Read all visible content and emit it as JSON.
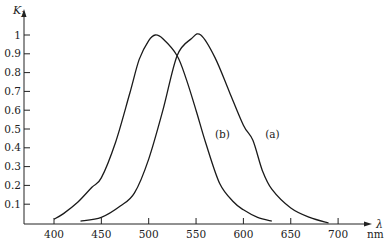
{
  "chart_data": {
    "type": "line",
    "title": "",
    "xlabel": "λ",
    "xunit": "nm",
    "ylabel": "K_λ",
    "xlim": [
      375,
      735
    ],
    "ylim": [
      0,
      1.1
    ],
    "grid": false,
    "legend": "inline curve labels",
    "x_ticks": [
      400,
      450,
      500,
      550,
      600,
      650,
      700
    ],
    "y_ticks": [
      0.1,
      0.2,
      0.3,
      0.4,
      0.5,
      0.6,
      0.7,
      0.8,
      0.9,
      1
    ],
    "y_tick_labels": [
      "0.1",
      "0.2",
      "0.3",
      "0.4",
      "0.5",
      "0.6",
      "0.7",
      "0.8",
      "0.9",
      "1"
    ],
    "series": [
      {
        "name": "(b)",
        "label_position": {
          "x_nm": 570,
          "y": 0.45
        },
        "x": [
          400,
          410,
          425,
          440,
          450,
          465,
          480,
          490,
          500,
          507,
          515,
          530,
          540,
          550,
          560,
          575,
          590,
          600,
          615,
          630
        ],
        "values": [
          0.02,
          0.05,
          0.11,
          0.19,
          0.24,
          0.43,
          0.69,
          0.87,
          0.97,
          1.0,
          0.98,
          0.89,
          0.76,
          0.6,
          0.43,
          0.21,
          0.11,
          0.07,
          0.03,
          0.01
        ]
      },
      {
        "name": "(a)",
        "label_position": {
          "x_nm": 623,
          "y": 0.45
        },
        "x": [
          428,
          450,
          470,
          485,
          500,
          515,
          530,
          545,
          555,
          570,
          585,
          600,
          610,
          620,
          630,
          650,
          670,
          690
        ],
        "values": [
          0.01,
          0.03,
          0.09,
          0.16,
          0.34,
          0.6,
          0.89,
          0.98,
          1.0,
          0.88,
          0.7,
          0.52,
          0.44,
          0.28,
          0.18,
          0.08,
          0.03,
          0.0
        ]
      }
    ]
  }
}
